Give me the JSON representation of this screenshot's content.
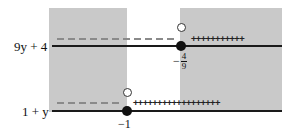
{
  "diagram": {
    "type": "sign-chart",
    "colors": {
      "shade": "#c9c9c9",
      "axis": "#1a1a1a",
      "dash": "#8a8a8a",
      "point": "#111111"
    },
    "rows": [
      {
        "label": "9y + 4",
        "critical_value": {
          "minus": "−",
          "numerator": "4",
          "denominator": "9"
        },
        "negative_sign": "− − − − − − − − −",
        "positive_signs": "+++++++++++"
      },
      {
        "label": "1 + y",
        "critical_value": {
          "text": "−1"
        },
        "negative_sign": "− − − − − −",
        "positive_signs": "++++++++++++++++++"
      }
    ]
  }
}
